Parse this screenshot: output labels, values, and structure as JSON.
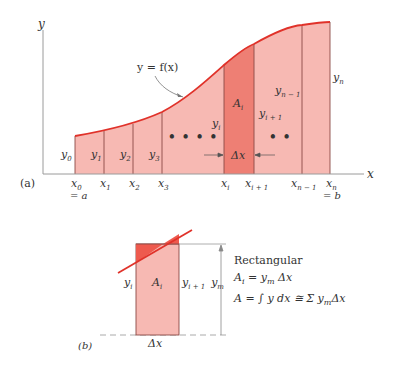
{
  "panel_a": {
    "label": "(a)",
    "axis_x_label": "x",
    "axis_y_label": "y",
    "curve_label": "y = f(x)",
    "strip_area_label": "A",
    "strip_area_sub": "i",
    "delta_label": "Δx",
    "ellipsis_left": "• • • •",
    "ellipsis_right": "• •",
    "ordinates": [
      {
        "base": "y",
        "sub": "0"
      },
      {
        "base": "y",
        "sub": "1"
      },
      {
        "base": "y",
        "sub": "2"
      },
      {
        "base": "y",
        "sub": "3"
      },
      {
        "base": "y",
        "sub": "i"
      },
      {
        "base": "y",
        "sub": "i + 1"
      },
      {
        "base": "y",
        "sub": "n − 1"
      },
      {
        "base": "y",
        "sub": "n"
      }
    ],
    "abscissas": [
      {
        "base": "x",
        "sub": "0",
        "note": "= a"
      },
      {
        "base": "x",
        "sub": "1"
      },
      {
        "base": "x",
        "sub": "2"
      },
      {
        "base": "x",
        "sub": "3"
      },
      {
        "base": "x",
        "sub": "i"
      },
      {
        "base": "x",
        "sub": "i + 1"
      },
      {
        "base": "x",
        "sub": "n − 1"
      },
      {
        "base": "x",
        "sub": "n",
        "note": "= b"
      }
    ]
  },
  "panel_b": {
    "label": "(b)",
    "area_label": "A",
    "area_sub": "i",
    "left_label": "y",
    "left_sub": "i",
    "right_label": "y",
    "right_sub": "i + 1",
    "height_label": "y",
    "height_sub": "m",
    "width_label": "Δx",
    "method_title": "Rectangular",
    "formula_1": {
      "lhs": "A",
      "lhs_sub": "i",
      "rhs": "= y",
      "rhs_sub": "m",
      "tail": "Δx"
    },
    "formula_2": {
      "text": "A = ∫ y dx ≅ Σ y",
      "sub": "m",
      "tail": "Δx"
    }
  },
  "colors": {
    "fill_light": "#f7b9b3",
    "fill_strip": "#ee7f74",
    "curve": "#e0322a",
    "divider": "#8a4a46",
    "axis": "#9a9a9a",
    "text": "#333333"
  }
}
